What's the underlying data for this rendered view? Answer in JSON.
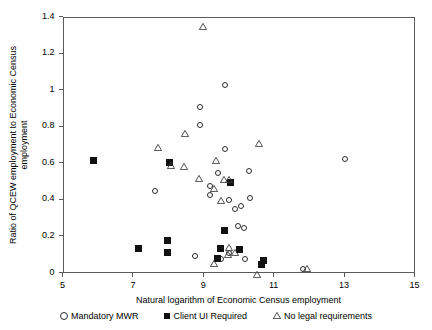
{
  "chart_data": {
    "type": "scatter",
    "title": "",
    "xlabel": "Natural logarithm of Economic Census employment",
    "ylabel": "Ratio of QCEW employment to Economic Census employment",
    "ylabel_lines": [
      "Ratio of QCEW employment to Economic Census",
      "employment"
    ],
    "xlim": [
      5,
      15
    ],
    "ylim": [
      0,
      1.4
    ],
    "xticks": [
      5,
      7,
      9,
      11,
      13,
      15
    ],
    "xtick_labels": [
      "5",
      "7",
      "9",
      "11",
      "13",
      "15"
    ],
    "yticks": [
      0,
      0.2,
      0.4,
      0.6,
      0.8,
      1.0,
      1.2,
      1.4
    ],
    "ytick_labels": [
      "0",
      "0.2",
      "0.4",
      "0.6",
      "0.8",
      "1",
      "1.2",
      "1.4"
    ],
    "grid": false,
    "legend_position": "bottom",
    "series": [
      {
        "name": "Mandatory MWR",
        "marker": "open-circle",
        "color": "#2b2b2b",
        "points": [
          [
            7.62,
            0.445
          ],
          [
            8.92,
            0.905
          ],
          [
            8.92,
            0.805
          ],
          [
            9.43,
            0.545
          ],
          [
            9.19,
            0.475
          ],
          [
            9.19,
            0.425
          ],
          [
            9.62,
            1.025
          ],
          [
            9.62,
            0.675
          ],
          [
            9.74,
            0.395
          ],
          [
            9.9,
            0.345
          ],
          [
            10.06,
            0.365
          ],
          [
            10.3,
            0.555
          ],
          [
            10.33,
            0.405
          ],
          [
            9.99,
            0.255
          ],
          [
            10.15,
            0.245
          ],
          [
            8.77,
            0.09
          ],
          [
            9.5,
            0.075
          ],
          [
            9.73,
            0.105
          ],
          [
            10.18,
            0.075
          ],
          [
            11.82,
            0.02
          ],
          [
            13.02,
            0.62
          ]
        ]
      },
      {
        "name": "Client UI Required",
        "marker": "filled-square",
        "color": "#111111",
        "points": [
          [
            5.87,
            0.615
          ],
          [
            8.04,
            0.6
          ],
          [
            7.16,
            0.13
          ],
          [
            7.99,
            0.175
          ],
          [
            7.97,
            0.11
          ],
          [
            9.61,
            0.23
          ],
          [
            9.78,
            0.49
          ],
          [
            9.5,
            0.13
          ],
          [
            10.02,
            0.125
          ],
          [
            9.4,
            0.075
          ],
          [
            10.65,
            0.045
          ],
          [
            10.72,
            0.065
          ]
        ]
      },
      {
        "name": "No legal requirements",
        "marker": "open-triangle",
        "color": "#3a3a3a",
        "points": [
          [
            9.0,
            1.385
          ],
          [
            7.71,
            0.72
          ],
          [
            8.48,
            0.8
          ],
          [
            8.45,
            0.62
          ],
          [
            8.07,
            0.625
          ],
          [
            8.87,
            0.555
          ],
          [
            9.35,
            0.65
          ],
          [
            9.3,
            0.5
          ],
          [
            9.59,
            0.545
          ],
          [
            9.72,
            0.545
          ],
          [
            9.5,
            0.43
          ],
          [
            10.58,
            0.745
          ],
          [
            9.72,
            0.175
          ],
          [
            9.7,
            0.135
          ],
          [
            9.91,
            0.15
          ],
          [
            9.3,
            0.09
          ],
          [
            10.52,
            0.03
          ],
          [
            11.95,
            0.06
          ]
        ]
      }
    ]
  },
  "legend": {
    "items": [
      {
        "label": "Mandatory MWR",
        "marker": "open-circle"
      },
      {
        "label": "Client UI Required",
        "marker": "filled-square"
      },
      {
        "label": "No legal requirements",
        "marker": "open-triangle"
      }
    ]
  }
}
